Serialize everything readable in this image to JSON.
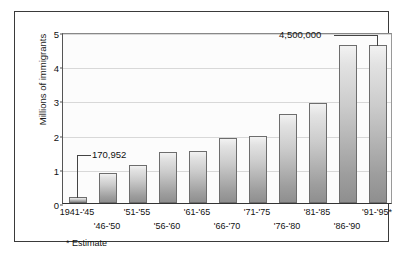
{
  "chart_data": {
    "type": "bar",
    "title": "",
    "subtitle": "",
    "xlabel": "",
    "ylabel": "Millions of immigrants",
    "ylim": [
      0,
      5
    ],
    "yticks": [
      0,
      1,
      2,
      3,
      4,
      5
    ],
    "ytick_labels": [
      "0",
      "1",
      "2",
      "3",
      "4",
      "5"
    ],
    "grid": true,
    "legend": "none",
    "categories": [
      "1941-'45",
      "'46-'50",
      "'51-'55",
      "'56-'60",
      "'61-'65",
      "'66-'70",
      "'71-'75",
      "'76-'80",
      "'81-'85",
      "'86-'90",
      "'91-'95*"
    ],
    "values": [
      0.17,
      0.88,
      1.12,
      1.48,
      1.52,
      1.91,
      1.97,
      2.6,
      2.92,
      4.62,
      4.62
    ],
    "annotations": [
      {
        "label": "170,952",
        "target_category": "1941-'45",
        "value": 0.170952
      },
      {
        "label": "4,500,000",
        "target_category": "'91-'95*",
        "value": 4.5
      }
    ],
    "footnote": "* Estimate",
    "bar_color": "#c4c4c4",
    "bar_edge_color": "#6d6d6d",
    "grid_color": "#d8d8d8",
    "axis_color": "#333333",
    "text_color": "#111111",
    "background_color": "#ffffff"
  }
}
